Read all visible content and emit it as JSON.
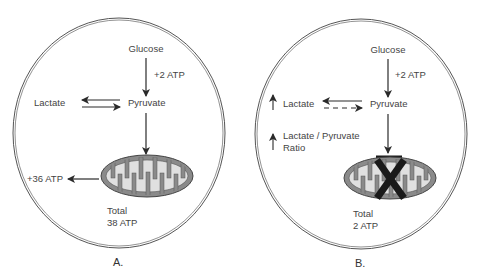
{
  "diagram": {
    "colors": {
      "membrane": "#555555",
      "text": "#444444",
      "arrow": "#2a2a2a",
      "mito_outer": "#8a8a8a",
      "mito_cristae": "#e0e0e0",
      "inhibit": "#1a1a1a"
    },
    "panel_a": {
      "label": "A.",
      "glucose": "Glucose",
      "glycolysis_atp": "+2 ATP",
      "pyruvate": "Pyruvate",
      "lactate": "Lactate",
      "mito_atp": "+36 ATP",
      "total_line1": "Total",
      "total_line2": "38 ATP"
    },
    "panel_b": {
      "label": "B.",
      "glucose": "Glucose",
      "glycolysis_atp": "+2 ATP",
      "pyruvate": "Pyruvate",
      "lactate": "Lactate",
      "ratio_line1": "Lactate / Pyruvate",
      "ratio_line2": "Ratio",
      "total_line1": "Total",
      "total_line2": "2 ATP"
    }
  }
}
